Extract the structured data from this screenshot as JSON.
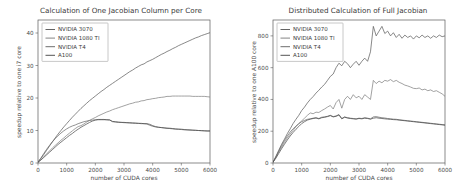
{
  "figure": {
    "width": 470,
    "height": 191,
    "background": "#ffffff",
    "panel_count": 2
  },
  "palette": {
    "series_1": "#5b5b5b",
    "series_2": "#7d7d7d",
    "series_3": "#666666",
    "series_4": "#4a4a4a",
    "axis": "#5a5a5a",
    "text": "#3a3a3a",
    "legend_border": "#9a9a9a"
  },
  "chart_data": [
    {
      "id": "left-panel",
      "type": "line",
      "title": "Calculation of One Jacobian Column per Core",
      "xlabel": "number of CUDA cores",
      "ylabel": "speedup relative to one i7 core",
      "xlim": [
        0,
        6000
      ],
      "ylim": [
        0,
        44
      ],
      "xticks": [
        0,
        1000,
        2000,
        3000,
        4000,
        5000,
        6000
      ],
      "xticklabels": [
        "0",
        "1000",
        "2000",
        "3000",
        "4000",
        "5000",
        "6000"
      ],
      "yticks": [
        0,
        10,
        20,
        30,
        40
      ],
      "yticklabels": [
        "0",
        "10",
        "20",
        "30",
        "40"
      ],
      "grid": false,
      "legend_position": "upper left",
      "legend_entries": [
        "NVIDIA 3070",
        "NVIDIA 1080 TI",
        "NVIDIA T4",
        "A100"
      ],
      "x": [
        0,
        100,
        200,
        300,
        400,
        500,
        600,
        700,
        800,
        900,
        1000,
        1100,
        1200,
        1300,
        1400,
        1500,
        1600,
        1700,
        1800,
        1900,
        2000,
        2100,
        2200,
        2300,
        2400,
        2500,
        2600,
        2700,
        2800,
        2900,
        3000,
        3100,
        3200,
        3300,
        3400,
        3500,
        3600,
        3700,
        3800,
        3900,
        4000,
        4100,
        4200,
        4300,
        4400,
        4500,
        4600,
        4700,
        4800,
        4900,
        5000,
        5100,
        5200,
        5300,
        5400,
        5500,
        5600,
        5700,
        5800,
        5900,
        6000
      ],
      "series": [
        {
          "name": "NVIDIA 3070",
          "color": "#5b5b5b",
          "values": [
            0.3,
            1.4,
            2.6,
            3.9,
            5.2,
            6.5,
            7.7,
            8.9,
            10.0,
            11.1,
            12.1,
            13.1,
            14.1,
            15.0,
            15.9,
            16.8,
            17.6,
            18.4,
            19.2,
            19.9,
            20.6,
            21.3,
            22.0,
            22.6,
            23.3,
            23.9,
            24.5,
            25.1,
            25.7,
            26.3,
            26.9,
            27.5,
            28.1,
            28.6,
            29.2,
            29.7,
            30.2,
            30.5,
            31.1,
            31.5,
            31.9,
            32.4,
            32.9,
            33.4,
            33.8,
            34.3,
            34.7,
            35.2,
            35.6,
            36.1,
            36.5,
            36.9,
            37.3,
            37.7,
            38.1,
            38.5,
            38.8,
            39.2,
            39.5,
            39.8,
            40.1
          ]
        },
        {
          "name": "NVIDIA 1080 TI",
          "color": "#7d7d7d",
          "values": [
            0.25,
            1.0,
            1.9,
            2.8,
            3.7,
            4.6,
            5.4,
            6.2,
            7.0,
            7.7,
            8.5,
            9.2,
            9.9,
            10.6,
            11.2,
            11.5,
            12.0,
            12.6,
            13.1,
            13.6,
            14.0,
            14.5,
            14.9,
            15.3,
            15.7,
            16.0,
            16.4,
            16.7,
            17.0,
            17.3,
            17.6,
            17.9,
            18.2,
            18.4,
            18.7,
            18.8,
            19.1,
            19.2,
            19.5,
            19.6,
            19.8,
            19.9,
            20.1,
            20.2,
            20.3,
            20.5,
            20.5,
            20.6,
            20.6,
            20.6,
            20.6,
            20.6,
            20.6,
            20.6,
            20.5,
            20.5,
            20.5,
            20.5,
            20.5,
            20.4,
            20.3
          ]
        },
        {
          "name": "NVIDIA T4",
          "color": "#666666",
          "values": [
            0.3,
            1.5,
            2.9,
            4.2,
            5.4,
            6.5,
            7.5,
            8.4,
            9.2,
            9.9,
            10.5,
            11.0,
            11.4,
            11.7,
            12.1,
            12.4,
            12.7,
            12.9,
            13.1,
            13.2,
            13.3,
            13.3,
            13.3,
            13.3,
            13.3,
            13.3,
            12.7,
            12.6,
            12.5,
            12.5,
            12.4,
            12.4,
            12.3,
            12.3,
            12.2,
            12.2,
            12.1,
            12.1,
            12.0,
            11.6,
            11.3,
            11.1,
            11.0,
            10.9,
            10.8,
            10.7,
            10.6,
            10.5,
            10.4,
            10.4,
            10.3,
            10.2,
            10.2,
            10.1,
            10.1,
            10.0,
            10.0,
            9.9,
            9.9,
            9.8,
            9.8
          ]
        },
        {
          "name": "A100",
          "color": "#4a4a4a",
          "values": [
            0.2,
            0.9,
            1.7,
            2.5,
            3.3,
            4.1,
            4.9,
            5.7,
            6.4,
            7.1,
            7.8,
            8.5,
            9.1,
            9.8,
            10.4,
            11.0,
            11.5,
            12.0,
            12.5,
            12.9,
            13.2,
            13.4,
            13.4,
            13.4,
            13.3,
            13.2,
            12.8,
            12.7,
            12.6,
            12.5,
            12.5,
            12.4,
            12.4,
            12.3,
            12.3,
            12.2,
            12.2,
            12.1,
            12.1,
            11.9,
            11.5,
            11.2,
            11.0,
            10.9,
            10.8,
            10.7,
            10.7,
            10.6,
            10.5,
            10.4,
            10.4,
            10.3,
            10.2,
            10.2,
            10.1,
            10.1,
            10.0,
            10.0,
            9.9,
            9.9,
            9.9
          ]
        }
      ]
    },
    {
      "id": "right-panel",
      "type": "line",
      "title": "Distributed Calculation of Full Jacobian",
      "xlabel": "number of CUDA cores",
      "ylabel": "speedup relative to one A100 core",
      "xlim": [
        0,
        6000
      ],
      "ylim": [
        0,
        900
      ],
      "xticks": [
        0,
        1000,
        2000,
        3000,
        4000,
        5000,
        6000
      ],
      "xticklabels": [
        "0",
        "1000",
        "2000",
        "3000",
        "4000",
        "5000",
        "6000"
      ],
      "yticks": [
        0,
        200,
        400,
        600,
        800
      ],
      "yticklabels": [
        "0",
        "200",
        "400",
        "600",
        "800"
      ],
      "grid": false,
      "legend_position": "upper left",
      "legend_entries": [
        "NVIDIA 3070",
        "NVIDIA 1080 TI",
        "NVIDIA T4",
        "A100"
      ],
      "x": [
        0,
        100,
        200,
        300,
        400,
        500,
        600,
        700,
        800,
        900,
        1000,
        1100,
        1200,
        1300,
        1400,
        1500,
        1600,
        1700,
        1800,
        1900,
        2000,
        2100,
        2200,
        2300,
        2400,
        2500,
        2600,
        2700,
        2800,
        2900,
        3000,
        3100,
        3200,
        3300,
        3400,
        3500,
        3600,
        3700,
        3800,
        3900,
        4000,
        4100,
        4200,
        4300,
        4400,
        4500,
        4600,
        4700,
        4800,
        4900,
        5000,
        5100,
        5200,
        5300,
        5400,
        5500,
        5600,
        5700,
        5800,
        5900,
        6000
      ],
      "series": [
        {
          "name": "NVIDIA 3070",
          "color": "#5b5b5b",
          "values": [
            5,
            42,
            80,
            118,
            150,
            185,
            215,
            248,
            275,
            300,
            330,
            352,
            378,
            400,
            418,
            440,
            458,
            478,
            495,
            520,
            545,
            560,
            600,
            628,
            612,
            640,
            625,
            600,
            622,
            640,
            615,
            640,
            660,
            640,
            700,
            860,
            800,
            830,
            860,
            815,
            830,
            800,
            820,
            790,
            810,
            785,
            805,
            790,
            800,
            780,
            800,
            788,
            805,
            790,
            800,
            785,
            800,
            790,
            805,
            795,
            800
          ]
        },
        {
          "name": "NVIDIA 1080 TI",
          "color": "#7d7d7d",
          "values": [
            5,
            36,
            70,
            100,
            130,
            158,
            182,
            205,
            228,
            248,
            265,
            282,
            300,
            315,
            310,
            320,
            318,
            330,
            340,
            352,
            362,
            340,
            380,
            400,
            345,
            400,
            420,
            400,
            430,
            410,
            420,
            400,
            430,
            415,
            400,
            520,
            500,
            515,
            505,
            520,
            515,
            525,
            512,
            520,
            508,
            500,
            490,
            485,
            478,
            470,
            468,
            472,
            460,
            465,
            455,
            460,
            450,
            455,
            445,
            435,
            420
          ]
        },
        {
          "name": "NVIDIA T4",
          "color": "#666666",
          "values": [
            5,
            38,
            75,
            110,
            142,
            170,
            195,
            215,
            232,
            248,
            260,
            268,
            275,
            278,
            282,
            285,
            280,
            288,
            290,
            294,
            300,
            292,
            296,
            305,
            280,
            290,
            285,
            282,
            280,
            278,
            282,
            280,
            285,
            282,
            278,
            290,
            292,
            288,
            285,
            283,
            280,
            278,
            276,
            275,
            272,
            270,
            268,
            266,
            264,
            262,
            260,
            258,
            256,
            254,
            252,
            250,
            248,
            246,
            244,
            242,
            240
          ]
        },
        {
          "name": "A100",
          "color": "#4a4a4a",
          "values": [
            5,
            30,
            60,
            90,
            118,
            145,
            170,
            192,
            212,
            230,
            248,
            260,
            270,
            276,
            280,
            283,
            278,
            285,
            288,
            292,
            298,
            290,
            294,
            302,
            278,
            288,
            283,
            280,
            278,
            276,
            280,
            278,
            282,
            280,
            276,
            282,
            285,
            282,
            280,
            278,
            276,
            275,
            273,
            272,
            270,
            268,
            266,
            264,
            262,
            260,
            258,
            256,
            254,
            252,
            250,
            248,
            246,
            244,
            242,
            240,
            238
          ]
        }
      ]
    }
  ]
}
